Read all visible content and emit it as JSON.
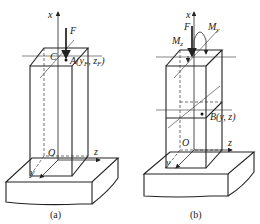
{
  "figure_a": {
    "caption": "(a)",
    "labels": {
      "x_axis": "x",
      "y_axis": "y",
      "z_axis": "z",
      "force": "F",
      "centroid": "C",
      "origin": "O",
      "point": "A(y",
      "point_sub1": "F",
      "point_mid": ", z",
      "point_sub2": "F",
      "point_close": ")"
    }
  },
  "figure_b": {
    "caption": "(b)",
    "labels": {
      "x_axis": "x",
      "y_axis": "y",
      "z_axis": "z",
      "force": "F",
      "moment_z": "M",
      "moment_z_sub": "z",
      "moment_y": "M",
      "moment_y_sub": "y",
      "origin": "O",
      "point": "B(y, z)"
    }
  }
}
